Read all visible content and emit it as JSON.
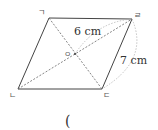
{
  "diagram": {
    "type": "parallelogram",
    "vertices": {
      "top_left": {
        "label": "ㄱ",
        "x": 49,
        "y": 18
      },
      "top_right": {
        "label": "ㄹ",
        "x": 132,
        "y": 19
      },
      "bottom_right": {
        "label": "ㄷ",
        "x": 102,
        "y": 89
      },
      "bottom_left": {
        "label": "ㄴ",
        "x": 18,
        "y": 89
      }
    },
    "center": {
      "label": "ㅇ",
      "x": 75,
      "y": 54
    },
    "measurements": {
      "half_diagonal": "6 cm",
      "side": "7 cm"
    },
    "answer_blank": "("
  },
  "colors": {
    "line": "#444444",
    "dashed": "#666666",
    "arc": "#aaaaaa",
    "text": "#333333"
  }
}
